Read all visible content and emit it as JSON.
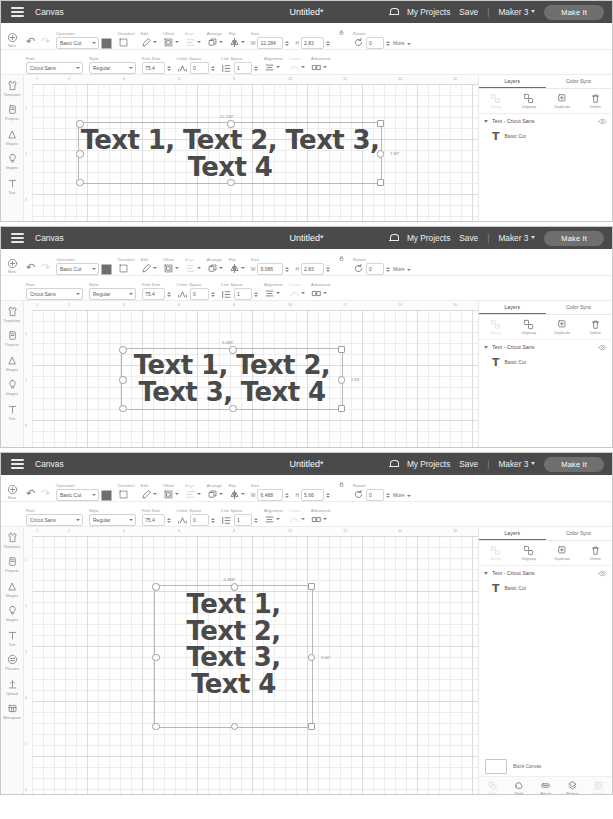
{
  "app": {
    "topbar": {
      "menu_icon": "hamburger-icon",
      "canvas_label": "Canvas",
      "title": "Untitled*",
      "bell_icon": "notification-bell-icon",
      "my_projects": "My Projects",
      "save": "Save",
      "separator": "|",
      "machine": "Maker 3",
      "make_it": "Make It",
      "bar_color": "#4a4a4a",
      "button_color": "#6f6f6f"
    },
    "toolbar_labels": {
      "undo": "undo-icon",
      "redo": "redo-icon",
      "operation": "Operation",
      "deselect": "Deselect",
      "edit": "Edit",
      "offset": "Offset",
      "align": "Align",
      "arrange": "Arrange",
      "flip": "Flip",
      "size": "Size",
      "lock": "lock-icon",
      "rotate": "Rotate",
      "more": "More",
      "font": "Font",
      "style": "Style",
      "font_size": "Font Size",
      "letter_space": "Letter Space",
      "line_space": "Line Space",
      "alignment": "Alignment",
      "curve": "Curve",
      "advanced": "Advanced",
      "width_prefix": "W",
      "height_prefix": "H"
    },
    "text_defaults": {
      "operation": "Basic Cut",
      "font": "Cricut Sans",
      "style": "Regular",
      "font_size": "75.4",
      "letter_space": "0",
      "line_space": "1",
      "rotate": "0"
    },
    "ruler": {
      "h_ticks": [
        "1",
        "2",
        "4",
        "6",
        "8",
        "10",
        "12",
        "14",
        "16"
      ],
      "v_ticks": [
        "1",
        "2",
        "3",
        "4",
        "5",
        "6"
      ]
    },
    "zoom": {
      "level": "75%",
      "minus": "-",
      "plus": "+"
    },
    "sidebar": {
      "items": [
        {
          "label": "New",
          "icon": "plus-circle-icon"
        },
        {
          "label": "Templates",
          "icon": "shirt-icon"
        },
        {
          "label": "Projects",
          "icon": "projects-icon"
        },
        {
          "label": "Shapes",
          "icon": "shapes-icon"
        },
        {
          "label": "Images",
          "icon": "image-bulb-icon"
        },
        {
          "label": "Text",
          "icon": "text-t-icon"
        },
        {
          "label": "Phrases",
          "icon": "phrases-icon"
        },
        {
          "label": "Upload",
          "icon": "upload-icon"
        },
        {
          "label": "Monogram",
          "icon": "monogram-icon"
        }
      ]
    },
    "layers_panel": {
      "tabs": [
        {
          "label": "Layers",
          "active": true
        },
        {
          "label": "Color Sync",
          "active": false
        }
      ],
      "actions": [
        {
          "label": "Group",
          "icon": "group-icon",
          "disabled": true
        },
        {
          "label": "Ungroup",
          "icon": "ungroup-icon",
          "disabled": false
        },
        {
          "label": "Duplicate",
          "icon": "duplicate-icon",
          "disabled": false
        },
        {
          "label": "Delete",
          "icon": "trash-icon",
          "disabled": false
        }
      ],
      "layer_group": "Text - Cricut Sans",
      "layer_child": "Basic Cut",
      "visibility_icon": "eye-icon"
    },
    "bottom_panel": {
      "blank_canvas": "Blank Canvas",
      "operations": [
        {
          "label": "Slice",
          "icon": "slice-icon",
          "disabled": true
        },
        {
          "label": "Weld",
          "icon": "weld-icon",
          "disabled": false
        },
        {
          "label": "Attach",
          "icon": "attach-icon",
          "disabled": false
        },
        {
          "label": "Flatten",
          "icon": "flatten-icon",
          "disabled": false
        },
        {
          "label": "Contour",
          "icon": "contour-icon",
          "disabled": true
        }
      ],
      "font_banner": "Use 700+ fonts for free",
      "font_banner_icon": "font-a-icon",
      "font_banner_color": "#5a5a5a"
    }
  },
  "panels": [
    {
      "id": "panel-1",
      "size": {
        "width": "12.284",
        "height": "2.83"
      },
      "canvas": {
        "text": "Text 1, Text 2, Text 3,\nText 4",
        "width_label": "12.284\"",
        "height_label": "2.83\"",
        "font_px": 26,
        "sel": {
          "left": 54,
          "top": 47,
          "width": 304,
          "height": 62
        },
        "text_top": 4
      }
    },
    {
      "id": "panel-2",
      "size": {
        "width": "9.086",
        "height": "2.83"
      },
      "canvas": {
        "text": "Text 1, Text 2,\nText 3, Text 4",
        "width_label": "9.086\"",
        "height_label": "2.83\"",
        "font_px": 26,
        "sel": {
          "left": 97,
          "top": 47,
          "width": 222,
          "height": 62
        },
        "text_top": 3
      }
    },
    {
      "id": "panel-3",
      "size": {
        "width": "6.488",
        "height": "5.66"
      },
      "canvas": {
        "text": "Text 1,\nText 2,\nText 3,\nText 4",
        "width_label": "6.488\"",
        "height_label": "5.66\"",
        "font_px": 26,
        "sel": {
          "left": 130,
          "top": 58,
          "width": 159,
          "height": 143
        },
        "text_top": 5
      }
    }
  ]
}
